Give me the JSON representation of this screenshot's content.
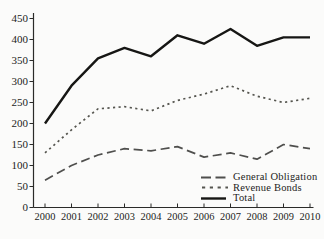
{
  "chart_data": {
    "type": "line",
    "title": "",
    "xlabel": "",
    "ylabel": "",
    "x_categories": [
      "2000",
      "2001",
      "2002",
      "2003",
      "2004",
      "2005",
      "2006",
      "2007",
      "2008",
      "2009",
      "2010"
    ],
    "yticks": [
      0,
      50,
      100,
      150,
      200,
      250,
      300,
      350,
      400,
      450
    ],
    "ylim": [
      0,
      450
    ],
    "grid": false,
    "legend_position": "inside-bottom-right",
    "series": [
      {
        "name": "General Obligation",
        "line_style": "dashed",
        "color": "#4f4f4d",
        "values": [
          65,
          100,
          125,
          140,
          135,
          145,
          120,
          130,
          115,
          150,
          140
        ]
      },
      {
        "name": "Revenue Bonds",
        "line_style": "dotted",
        "color": "#55554f",
        "values": [
          130,
          185,
          235,
          240,
          230,
          255,
          270,
          290,
          265,
          250,
          260
        ]
      },
      {
        "name": "Total",
        "line_style": "solid",
        "color": "#161614",
        "values": [
          200,
          290,
          355,
          380,
          360,
          410,
          390,
          425,
          385,
          405,
          405
        ]
      }
    ]
  },
  "colors": {
    "background": "#fbfbfa",
    "axis": "#2b2b29",
    "tick_text": "#1d1d1b"
  }
}
